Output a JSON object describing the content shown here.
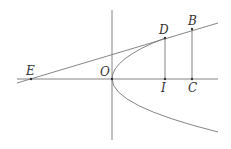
{
  "diagram": {
    "type": "geometry",
    "colors": {
      "line": "#777777",
      "text": "#333333",
      "background": "#ffffff"
    },
    "points": {
      "E": {
        "label": "E",
        "x": 31,
        "y": 79
      },
      "O": {
        "label": "O",
        "x": 112,
        "y": 79
      },
      "D": {
        "label": "D",
        "x": 165,
        "y": 38
      },
      "I": {
        "label": "I",
        "x": 165,
        "y": 79
      },
      "B": {
        "label": "B",
        "x": 192,
        "y": 29
      },
      "C": {
        "label": "C",
        "x": 192,
        "y": 79
      }
    },
    "labels": [
      "E",
      "O",
      "D",
      "I",
      "B",
      "C"
    ]
  }
}
